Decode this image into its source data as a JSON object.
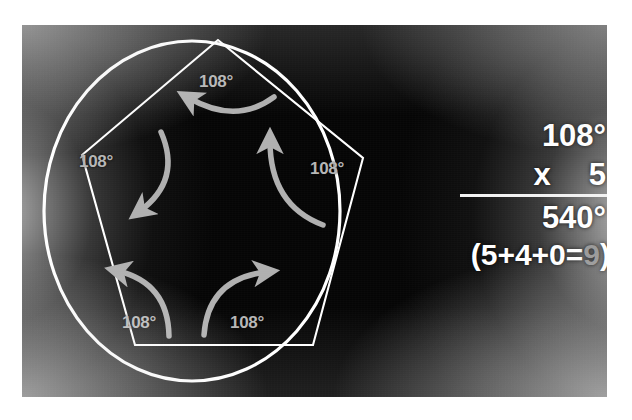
{
  "figure": {
    "shape_names": {
      "circle": "circumscribed-circle",
      "polygon": "regular-pentagon"
    },
    "angle_value": "108°",
    "angles": [
      {
        "id": "top",
        "label": "108°",
        "vertex_name": "pentagon-vertex-top"
      },
      {
        "id": "left",
        "label": "108°",
        "vertex_name": "pentagon-vertex-left"
      },
      {
        "id": "right",
        "label": "108°",
        "vertex_name": "pentagon-vertex-right"
      },
      {
        "id": "bottom-left",
        "label": "108°",
        "vertex_name": "pentagon-vertex-bottom-left"
      },
      {
        "id": "bottom-right",
        "label": "108°",
        "vertex_name": "pentagon-vertex-bottom-right"
      }
    ]
  },
  "math": {
    "multiplicand": "108°",
    "operator": "x",
    "multiplier": "5",
    "product": "540°",
    "digit_sum_open": "(5+4+0=",
    "digit_sum_result": "9",
    "digit_sum_close": ")"
  },
  "colors": {
    "line_white": "#ffffff",
    "label_gray": "#b6b6b6",
    "result_gray": "#9a9a9a",
    "background_black": "#050505",
    "photo_border": "#ffffff"
  }
}
